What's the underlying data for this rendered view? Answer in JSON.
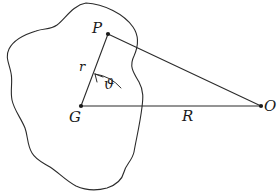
{
  "figure": {
    "background_color": "#ffffff",
    "stroke_color": "#2b2b2b",
    "labels": {
      "point_p": "P",
      "point_g": "G",
      "point_o": "O",
      "vector_r": "r",
      "distance_R": "R",
      "angle_theta": "ϑ"
    },
    "geometry": {
      "point_p": {
        "x": 108,
        "y": 34
      },
      "point_g": {
        "x": 81,
        "y": 106
      },
      "point_o": {
        "x": 261,
        "y": 106
      },
      "segment_gp": "M 81 106 L 108 34",
      "segment_go": "M 81 106 L 261 106",
      "segment_po": "M 108 34 L 261 106",
      "angle_arc": "M 121 88 A 42 42 0 0 0 95 74",
      "body_outline": "M 86 3 C 104 4 124 14 133 27 C 140 37 138 47 134 56 C 129 66 133 72 139 82 C 144 91 143 99 142 107 C 140 124 136 140 134 152 C 132 161 126 164 124 172 C 122 180 116 185 107 188 C 96 191 85 190 76 186 C 66 181 58 172 50 167 C 42 162 36 160 32 153 C 27 145 28 136 25 128 C 21 118 14 110 12 100 C 10 90 13 82 11 73 C 9 63 5 57 9 49 C 14 39 26 34 36 31 C 45 28 50 30 57 25 C 65 19 73 5 86 3 Z"
    }
  }
}
